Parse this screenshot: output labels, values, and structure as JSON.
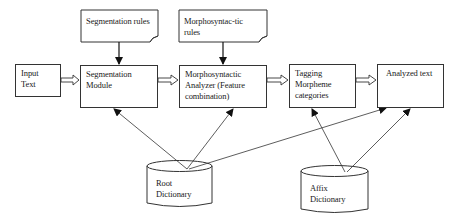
{
  "diagram": {
    "nodes": {
      "input_text": {
        "label_line1": "Input",
        "label_line2": "Text",
        "shape": "rectangle"
      },
      "segmentation_rules": {
        "label": "Segmentation rules",
        "shape": "document"
      },
      "morphosyntactic_rules": {
        "label_line1": "Morphosyntac-tic",
        "label_line2": "rules",
        "shape": "document"
      },
      "segmentation_module": {
        "label_line1": "Segmentation",
        "label_line2": "Module",
        "shape": "rectangle"
      },
      "morphosyntactic_analyzer": {
        "label_line1": "Morphosyntactic",
        "label_line2": "Analyzer (Feature",
        "label_line3": "combination)",
        "shape": "rectangle"
      },
      "tagging": {
        "label_line1": "Tagging",
        "label_line2": "Morpheme",
        "label_line3": "categories",
        "shape": "rectangle"
      },
      "analyzed_text": {
        "label": "Analyzed text",
        "shape": "rectangle"
      },
      "root_dictionary": {
        "label_line1": "Root",
        "label_line2": "Dictionary",
        "shape": "cylinder"
      },
      "affix_dictionary": {
        "label_line1": "Affix",
        "label_line2": "Dictionary",
        "shape": "cylinder"
      }
    },
    "edges": [
      {
        "from": "input_text",
        "to": "segmentation_module",
        "style": "hollow-double-arrow"
      },
      {
        "from": "segmentation_module",
        "to": "morphosyntactic_analyzer",
        "style": "hollow-double-arrow"
      },
      {
        "from": "morphosyntactic_analyzer",
        "to": "tagging",
        "style": "hollow-double-arrow"
      },
      {
        "from": "tagging",
        "to": "analyzed_text",
        "style": "hollow-double-arrow"
      },
      {
        "from": "segmentation_rules",
        "to": "segmentation_module",
        "style": "solid-arrow"
      },
      {
        "from": "morphosyntactic_rules",
        "to": "morphosyntactic_analyzer",
        "style": "solid-arrow"
      },
      {
        "from": "root_dictionary",
        "to": "segmentation_module",
        "style": "thin-arrow"
      },
      {
        "from": "root_dictionary",
        "to": "morphosyntactic_analyzer",
        "style": "thin-arrow"
      },
      {
        "from": "root_dictionary",
        "to": "analyzed_text",
        "style": "thin-arrow"
      },
      {
        "from": "affix_dictionary",
        "to": "tagging",
        "style": "thin-arrow"
      },
      {
        "from": "affix_dictionary",
        "to": "analyzed_text",
        "style": "thin-arrow"
      }
    ],
    "colors": {
      "stroke": "#333333",
      "background": "#ffffff",
      "text": "#1a1a1a"
    }
  }
}
